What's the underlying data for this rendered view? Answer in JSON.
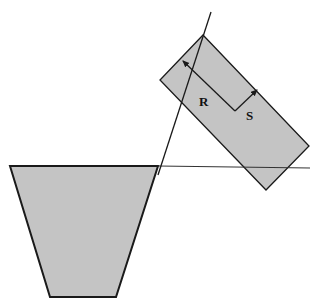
{
  "diagram": {
    "colors": {
      "fill": "#c4c4c4",
      "stroke": "#1a1a1a",
      "background": "#ffffff"
    },
    "labels": {
      "r": "R",
      "s": "S"
    },
    "shapes": {
      "trapezoid": [
        [
          10,
          166
        ],
        [
          158,
          166
        ],
        [
          116,
          297
        ],
        [
          50,
          297
        ]
      ],
      "rectangle": [
        [
          203,
          35
        ],
        [
          309,
          146
        ],
        [
          266,
          190
        ],
        [
          160,
          80
        ]
      ],
      "horizontal_line": [
        [
          158,
          166
        ],
        [
          310,
          168
        ]
      ],
      "slanted_line": [
        [
          211,
          12
        ],
        [
          116,
          297
        ]
      ]
    },
    "vectors": {
      "r": {
        "from": [
          235,
          111
        ],
        "to": [
          183,
          61
        ]
      },
      "s": {
        "from": [
          235,
          111
        ],
        "to": [
          257,
          90
        ]
      }
    }
  }
}
